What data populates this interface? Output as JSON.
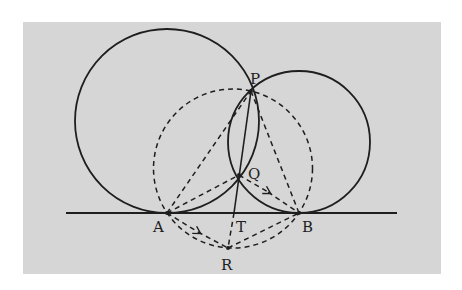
{
  "diagram": {
    "background_color": "#d6d6d6",
    "ink_color": "#1e1e1e",
    "points": {
      "P": {
        "label": "P",
        "x": 251,
        "y": 91
      },
      "Q": {
        "label": "Q",
        "x": 239,
        "y": 175
      },
      "A": {
        "label": "A",
        "x": 167,
        "y": 213
      },
      "B": {
        "label": "B",
        "x": 299,
        "y": 213
      },
      "T": {
        "label": "T",
        "x": 234,
        "y": 213
      },
      "R": {
        "label": "R",
        "x": 228,
        "y": 248
      }
    },
    "tangent_line": {
      "x1": 66,
      "x2": 397,
      "y": 213
    },
    "circles": [
      {
        "name": "large-circle",
        "cx": 167,
        "cy": 121,
        "r": 92,
        "style": "solid"
      },
      {
        "name": "small-circle",
        "cx": 299,
        "cy": 142,
        "r": 71,
        "style": "solid"
      },
      {
        "name": "dashed-circle",
        "cx": 233,
        "cy": 168.5,
        "r": 79.5,
        "style": "dashed"
      }
    ]
  }
}
